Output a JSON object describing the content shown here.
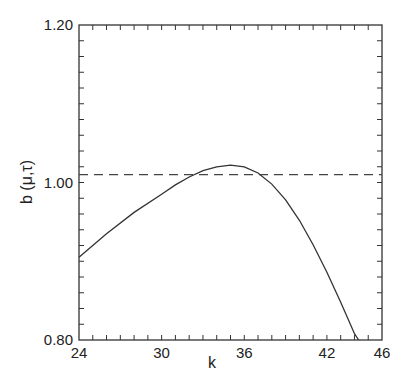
{
  "chart_data": {
    "type": "line",
    "title": "",
    "xlabel": "k",
    "ylabel": "b (μ,τ)",
    "xlim": [
      24,
      46
    ],
    "ylim": [
      0.8,
      1.2
    ],
    "x_ticks": [
      24,
      30,
      36,
      42,
      46
    ],
    "x_tick_labels": [
      "24",
      "30",
      "36",
      "42",
      "46"
    ],
    "y_ticks": [
      0.8,
      1.0,
      1.2
    ],
    "y_tick_labels": [
      "0.80",
      "1.00",
      "1.20"
    ],
    "grid": false,
    "legend": null,
    "series": [
      {
        "name": "b(μ,τ) curve",
        "style": "solid",
        "x": [
          24,
          26,
          28,
          30,
          31,
          32,
          33,
          34,
          35,
          36,
          37,
          38,
          39,
          40,
          41,
          42,
          43,
          44,
          44.3
        ],
        "y": [
          0.905,
          0.935,
          0.962,
          0.985,
          0.997,
          1.007,
          1.015,
          1.02,
          1.022,
          1.02,
          1.012,
          0.998,
          0.978,
          0.952,
          0.921,
          0.886,
          0.848,
          0.808,
          0.8
        ]
      },
      {
        "name": "reference level",
        "style": "dashed",
        "x": [
          24,
          46
        ],
        "y": [
          1.01,
          1.01
        ]
      }
    ]
  }
}
